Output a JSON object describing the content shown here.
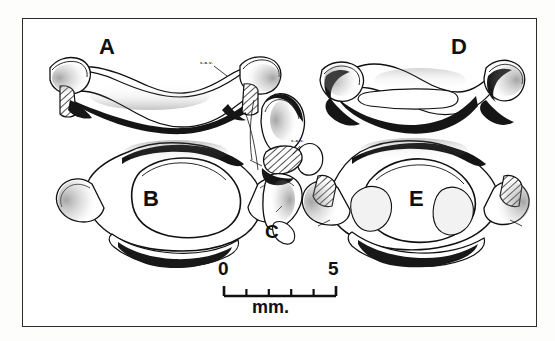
{
  "plate": {
    "type": "scientific-illustration-plate",
    "subject": "vertebrae line drawings",
    "background_color": "#fdfdfc",
    "frame_color": "#2b2b2b",
    "ink_color": "#101010"
  },
  "figures": [
    {
      "id": "A",
      "label": "A",
      "description": "wing-shaped vertebral arch, anterior view, hatched broken surfaces at both ends"
    },
    {
      "id": "B",
      "label": "B",
      "description": "ring-shaped vertebra with large central foramen, anterior view"
    },
    {
      "id": "C",
      "label": "C",
      "description": "narrow lateral view of vertebra with hatched broken surface"
    },
    {
      "id": "D",
      "label": "D",
      "description": "wing-shaped vertebral arch, complete, opposite view"
    },
    {
      "id": "E",
      "label": "E",
      "description": "ring-shaped vertebra with central foramen and hatched lateral surfaces"
    }
  ],
  "annotations": [
    {
      "id": "anno-A",
      "text": "s.a.v."
    },
    {
      "id": "anno-C",
      "text": "s.a.v."
    }
  ],
  "scale_bar": {
    "start_label": "0",
    "end_label": "5",
    "unit_label": "mm.",
    "major_ticks": 2,
    "minor_ticks": 4,
    "span_value": 5
  }
}
